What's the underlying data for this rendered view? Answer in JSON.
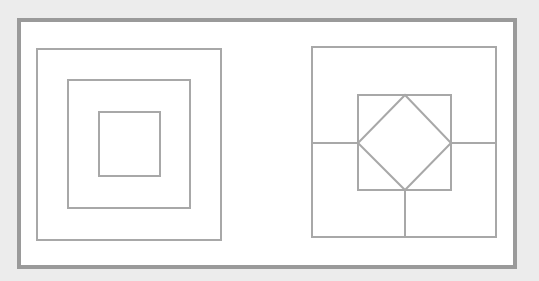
{
  "diagram": {
    "title": "",
    "colors": {
      "background": "#ececec",
      "panel": "#ffffff",
      "frame": "#9a9a9a",
      "line": "#a8a8a8"
    },
    "frame": {
      "x": 19,
      "y": 20,
      "width": 496,
      "height": 247,
      "stroke_width": 4
    },
    "figures": [
      {
        "name": "concentric-squares",
        "squares": [
          {
            "x": 37,
            "y": 49,
            "width": 184,
            "height": 191
          },
          {
            "x": 68,
            "y": 80,
            "width": 122,
            "height": 128
          },
          {
            "x": 99,
            "y": 112,
            "width": 61,
            "height": 64
          }
        ]
      },
      {
        "name": "square-with-diamond",
        "outer_square": {
          "x": 312,
          "y": 47,
          "width": 184,
          "height": 190
        },
        "inner_square": {
          "x": 358,
          "y": 95,
          "width": 93,
          "height": 95
        },
        "diamond": [
          [
            405,
            95
          ],
          [
            451,
            143
          ],
          [
            405,
            190
          ],
          [
            358,
            143
          ]
        ],
        "connectors": [
          {
            "x1": 312,
            "y1": 143,
            "x2": 358,
            "y2": 143
          },
          {
            "x1": 451,
            "y1": 143,
            "x2": 496,
            "y2": 143
          },
          {
            "x1": 405,
            "y1": 190,
            "x2": 405,
            "y2": 237
          }
        ]
      }
    ]
  }
}
